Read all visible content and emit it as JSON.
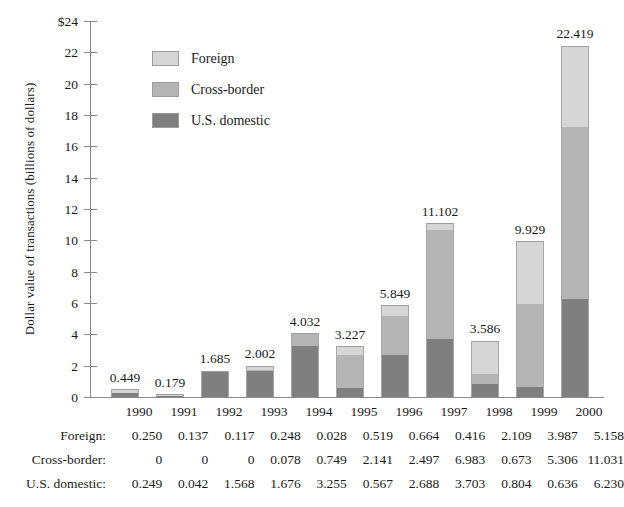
{
  "chart_data": {
    "type": "bar",
    "subtype": "stacked-bar",
    "title": "",
    "xlabel": "",
    "ylabel": "Dollar value of transactions (billions of dollars)",
    "ylim": [
      0,
      24
    ],
    "ytick_step": 2,
    "ytick_labels": [
      "$24",
      "22",
      "20",
      "18",
      "16",
      "14",
      "12",
      "10",
      "8",
      "6",
      "4",
      "2",
      "0"
    ],
    "ytick_values": [
      24,
      22,
      20,
      18,
      16,
      14,
      12,
      10,
      8,
      6,
      4,
      2,
      0
    ],
    "grid": false,
    "legend_position": "upper-left-inside",
    "categories": [
      "1990",
      "1991",
      "1992",
      "1993",
      "1994",
      "1995",
      "1996",
      "1997",
      "1998",
      "1999",
      "2000"
    ],
    "stack_order_bottom_to_top": [
      "U.S. domestic",
      "Cross-border",
      "Foreign"
    ],
    "series": [
      {
        "name": "Foreign",
        "color": "#d6d6d6",
        "values": [
          0.25,
          0.137,
          0.117,
          0.248,
          0.028,
          0.519,
          0.664,
          0.416,
          2.109,
          3.987,
          5.158
        ],
        "labels": [
          "0.250",
          "0.137",
          "0.117",
          "0.248",
          "0.028",
          "0.519",
          "0.664",
          "0.416",
          "2.109",
          "3.987",
          "5.158"
        ]
      },
      {
        "name": "Cross-border",
        "color": "#b5b5b5",
        "values": [
          0,
          0,
          0,
          0.078,
          0.749,
          2.141,
          2.497,
          6.983,
          0.673,
          5.306,
          11.031
        ],
        "labels": [
          "0",
          "0",
          "0",
          "0.078",
          "0.749",
          "2.141",
          "2.497",
          "6.983",
          "0.673",
          "5.306",
          "11.031"
        ]
      },
      {
        "name": "U.S. domestic",
        "color": "#7f7f7f",
        "values": [
          0.249,
          0.042,
          1.568,
          1.676,
          3.255,
          0.567,
          2.688,
          3.703,
          0.804,
          0.636,
          6.23
        ],
        "labels": [
          "0.249",
          "0.042",
          "1.568",
          "1.676",
          "3.255",
          "0.567",
          "2.688",
          "3.703",
          "0.804",
          "0.636",
          "6.230"
        ]
      }
    ],
    "totals": [
      0.449,
      0.179,
      1.685,
      2.002,
      4.032,
      3.227,
      5.849,
      11.102,
      3.586,
      9.929,
      22.419
    ],
    "total_labels": [
      "0.449",
      "0.179",
      "1.685",
      "2.002",
      "4.032",
      "3.227",
      "5.849",
      "11.102",
      "3.586",
      "9.929",
      "22.419"
    ]
  },
  "legend": {
    "items": [
      {
        "label": "Foreign",
        "color": "#d6d6d6"
      },
      {
        "label": "Cross-border",
        "color": "#b5b5b5"
      },
      {
        "label": "U.S. domestic",
        "color": "#7f7f7f"
      }
    ]
  },
  "table": {
    "rows": [
      {
        "label": "Foreign:",
        "values": [
          "0.250",
          "0.137",
          "0.117",
          "0.248",
          "0.028",
          "0.519",
          "0.664",
          "0.416",
          "2.109",
          "3.987",
          "5.158"
        ]
      },
      {
        "label": "Cross-border:",
        "values": [
          "0",
          "0",
          "0",
          "0.078",
          "0.749",
          "2.141",
          "2.497",
          "6.983",
          "0.673",
          "5.306",
          "11.031"
        ]
      },
      {
        "label": "U.S. domestic:",
        "values": [
          "0.249",
          "0.042",
          "1.568",
          "1.676",
          "3.255",
          "0.567",
          "2.688",
          "3.703",
          "0.804",
          "0.636",
          "6.230"
        ]
      }
    ]
  },
  "axis": {
    "y_title": "Dollar value of transactions (billions of dollars)"
  }
}
